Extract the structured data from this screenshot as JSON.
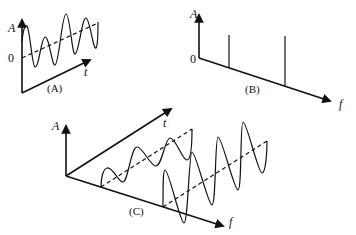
{
  "figure": {
    "panel_a": {
      "caption": "(A)",
      "y_label": "A",
      "origin_label": "0",
      "x_label": "t",
      "description": "Time-domain signal: sum of sinusoids oscillating around a rising dashed baseline"
    },
    "panel_b": {
      "caption": "(B)",
      "y_label": "A",
      "origin_label": "0",
      "x_label": "f",
      "description": "Frequency-domain spectrum with two spectral lines",
      "spectral_lines": [
        {
          "position": "low frequency",
          "relative_height": "equal"
        },
        {
          "position": "higher frequency",
          "relative_height": "equal"
        }
      ]
    },
    "panel_c": {
      "caption": "(C)",
      "y_label": "A",
      "t_label": "t",
      "f_label": "f",
      "description": "3D view showing decomposition of the signal into two sinusoidal components along the frequency axis",
      "components": [
        {
          "name": "low-frequency component",
          "cycles_visible": 2
        },
        {
          "name": "high-frequency component",
          "cycles_visible": 4
        }
      ]
    }
  }
}
